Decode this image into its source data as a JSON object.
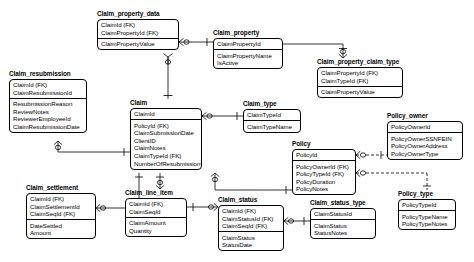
{
  "diagram": {
    "notation": "crow's foot",
    "entities": [
      {
        "id": "claim_property_data",
        "name": "Claim_property_data",
        "x": 97,
        "y": 10,
        "w": 82,
        "keys": [
          "ClaimId (FK)",
          "ClaimPropertyId (FK)"
        ],
        "attributes": [
          "ClaimPropertyValue"
        ]
      },
      {
        "id": "claim_property",
        "name": "Claim_property",
        "x": 213,
        "y": 29,
        "w": 70,
        "keys": [
          "ClaimPropertyId"
        ],
        "attributes": [
          "ClaimPropertyName",
          "IsActive"
        ]
      },
      {
        "id": "claim_property_claim_type",
        "name": "Claim_property_claim_type",
        "x": 317,
        "y": 58,
        "w": 86,
        "keys": [
          "ClaimPropertyId (FK)",
          "ClaimTypeId (FK)"
        ],
        "attributes": [
          "ClaimPropertyValue"
        ]
      },
      {
        "id": "claim_resubmission",
        "name": "Claim_resubmission",
        "x": 9,
        "y": 70,
        "w": 78,
        "keys": [
          "ClaimId (FK)",
          "ClaimResubmissionId"
        ],
        "attributes": [
          "ResubmissionReason",
          "ReviewNotes",
          "ReviewerEmployeeId",
          "ClaimResubmissionDate"
        ]
      },
      {
        "id": "claim",
        "name": "Claim",
        "x": 130,
        "y": 99,
        "w": 72,
        "keys": [
          "ClaimId"
        ],
        "attributes": [
          "PolicyId (FK)",
          "ClaimSubmissionDate",
          "ClientID",
          "ClaimNotes",
          "ClaimTypeId (FK)",
          "NumberOfResubmissions"
        ]
      },
      {
        "id": "claim_type",
        "name": "Claim_type",
        "x": 243,
        "y": 100,
        "w": 58,
        "keys": [
          "ClaimTypeId"
        ],
        "attributes": [
          "ClaimTypeName"
        ]
      },
      {
        "id": "policy_owner",
        "name": "Policy_owner",
        "x": 387,
        "y": 112,
        "w": 76,
        "keys": [
          "PolicyOwnerId"
        ],
        "attributes": [
          "PolicyOwnerSSNFEIN",
          "PolicyOwnerAddress",
          "PolicyOwnerType"
        ]
      },
      {
        "id": "policy",
        "name": "Policy",
        "x": 292,
        "y": 140,
        "w": 64,
        "keys": [
          "PolicyId"
        ],
        "attributes": [
          "PolicyOwnerId (FK)",
          "PolicyTypeId (FK)",
          "PolicyDuration",
          "PolicyNotes"
        ]
      },
      {
        "id": "claim_settlement",
        "name": "Claim_settlement",
        "x": 26,
        "y": 184,
        "w": 70,
        "keys": [
          "ClaimId (FK)",
          "ClaimSettlementId",
          "ClaimSeqId (FK)"
        ],
        "attributes": [
          "DateSettled",
          "Amount"
        ]
      },
      {
        "id": "claim_line_item",
        "name": "Claim_line_item",
        "x": 125,
        "y": 189,
        "w": 62,
        "keys": [
          "ClaimId (FK)",
          "ClaimSeqId"
        ],
        "attributes": [
          "ClaimAmount",
          "Quantity"
        ]
      },
      {
        "id": "claim_status",
        "name": "Claim_status",
        "x": 218,
        "y": 196,
        "w": 66,
        "keys": [
          "ClaimId (FK)",
          "ClaimStatusId (FK)",
          "ClaimSeqId (FK)"
        ],
        "attributes": [
          "ClaimStatus",
          "StatusDate"
        ]
      },
      {
        "id": "claim_status_type",
        "name": "Claim_status_type",
        "x": 310,
        "y": 199,
        "w": 66,
        "keys": [
          "ClaimStatusId"
        ],
        "attributes": [
          "ClaimStatus",
          "StatusNotes"
        ]
      },
      {
        "id": "policy_type",
        "name": "Policy_type",
        "x": 398,
        "y": 190,
        "w": 58,
        "keys": [
          "PolicyTypeId"
        ],
        "attributes": [
          "PolicyTypeName",
          "PolicyTypeNotes"
        ]
      }
    ],
    "relationships": [
      {
        "from": "claim",
        "to": "claim_property_data",
        "from_card": "one",
        "to_card": "zero-or-many"
      },
      {
        "from": "claim_property_data",
        "to": "claim_property",
        "from_card": "zero-or-many",
        "to_card": "one"
      },
      {
        "from": "claim_property",
        "to": "claim_property_claim_type",
        "from_card": "one",
        "to_card": "zero-or-many"
      },
      {
        "from": "claim_resubmission",
        "to": "claim",
        "from_card": "zero-or-many",
        "to_card": "one"
      },
      {
        "from": "claim",
        "to": "claim_type",
        "from_card": "zero-or-many",
        "to_card": "one"
      },
      {
        "from": "claim",
        "to": "claim_line_item",
        "from_card": "one",
        "to_card": "zero-or-many"
      },
      {
        "from": "claim",
        "to": "claim_settlement",
        "from_card": "one",
        "to_card": "zero-or-many"
      },
      {
        "from": "claim_line_item",
        "to": "claim_status",
        "from_card": "zero-or-many",
        "to_card": "one"
      },
      {
        "from": "claim_status",
        "to": "claim_status_type",
        "from_card": "zero-or-many",
        "to_card": "one"
      },
      {
        "from": "policy",
        "to": "claim",
        "from_card": "one",
        "to_card": "zero-or-many"
      },
      {
        "from": "policy",
        "to": "policy_owner",
        "from_card": "zero-or-many",
        "to_card": "one"
      },
      {
        "from": "policy",
        "to": "policy_type",
        "from_card": "zero-or-many",
        "to_card": "one"
      }
    ]
  },
  "colors": {
    "background": "#ffffff",
    "line": "#000000",
    "text": "#000000",
    "border": "#000000"
  }
}
